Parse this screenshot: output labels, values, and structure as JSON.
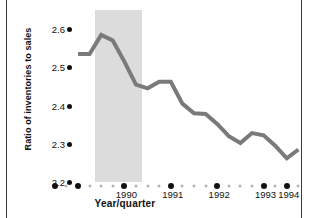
{
  "chart_data": {
    "type": "line",
    "title": "",
    "xlabel": "Year/quarter",
    "ylabel": "Ratio of inventories to sales",
    "ylim": [
      2.2,
      2.65
    ],
    "yticks": [
      2.6,
      2.5,
      2.4,
      2.3,
      2.2
    ],
    "ytick_labels": [
      "2.6",
      "2.5",
      "2.4",
      "2.3",
      "2.2"
    ],
    "grid": false,
    "legend": null,
    "x_major_labels": [
      "1990",
      "1991",
      "1992",
      "1993",
      "1994"
    ],
    "x_quarters_per_year": 4,
    "x": [
      "1989Q3",
      "1989Q4",
      "1990Q1",
      "1990Q2",
      "1990Q3",
      "1990Q4",
      "1991Q1",
      "1991Q2",
      "1991Q3",
      "1991Q4",
      "1992Q1",
      "1992Q2",
      "1992Q3",
      "1992Q4",
      "1993Q1",
      "1993Q2",
      "1993Q3",
      "1993Q4",
      "1994Q1",
      "1994Q2"
    ],
    "values": [
      2.535,
      2.535,
      2.585,
      2.57,
      2.515,
      2.455,
      2.445,
      2.462,
      2.462,
      2.405,
      2.38,
      2.378,
      2.352,
      2.32,
      2.302,
      2.328,
      2.322,
      2.295,
      2.262,
      2.285
    ],
    "shaded_region": {
      "label": "recession",
      "start": "1990Q1",
      "end": "1990Q4",
      "color": "#dcdcdc"
    },
    "line_color": "#7a7a7a",
    "line_width": 4
  },
  "axes": {
    "y_title": "Ratio of inventories to sales",
    "x_title": "Year/quarter",
    "y_ticks": [
      {
        "label": "2.6",
        "value": 2.6
      },
      {
        "label": "2.5",
        "value": 2.5
      },
      {
        "label": "2.4",
        "value": 2.4
      },
      {
        "label": "2.3",
        "value": 2.3
      },
      {
        "label": "2.2",
        "value": 2.2
      }
    ],
    "x_ticks": [
      {
        "label": "1990"
      },
      {
        "label": "1991"
      },
      {
        "label": "1992"
      },
      {
        "label": "1993"
      },
      {
        "label": "1994"
      }
    ]
  },
  "colors": {
    "line": "#7a7a7a",
    "shade": "#dcdcdc",
    "text": "#111111",
    "frame": "#3a3a3a",
    "minor_dot": "#b4b4b4",
    "major_dot": "#111111"
  }
}
